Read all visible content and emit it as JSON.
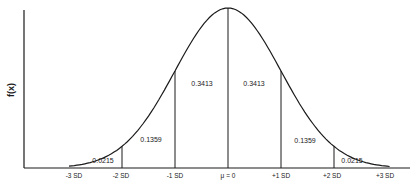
{
  "chart_data": {
    "type": "line",
    "title": "",
    "xlabel": "",
    "ylabel": "f(x)",
    "x_ticks": [
      "-3 SD",
      "-2 SD",
      "-1 SD",
      "μ = 0",
      "+1 SD",
      "+2 SD",
      "+3 SD"
    ],
    "x_tick_values": [
      -3,
      -2,
      -1,
      0,
      1,
      2,
      3
    ],
    "areas": [
      {
        "from": -3,
        "to": -2,
        "label": "0.0215"
      },
      {
        "from": -2,
        "to": -1,
        "label": "0.1359"
      },
      {
        "from": -1,
        "to": 0,
        "label": "0.3413"
      },
      {
        "from": 0,
        "to": 1,
        "label": "0.3413"
      },
      {
        "from": 1,
        "to": 2,
        "label": "0.1359"
      },
      {
        "from": 2,
        "to": 3,
        "label": "0.0215"
      }
    ],
    "xlim": [
      -3.2,
      3.2
    ],
    "grid": false,
    "legend": null
  },
  "labels": {
    "ylabel": "f(x)",
    "ticks": {
      "m3": "-3 SD",
      "m2": "-2 SD",
      "m1": "-1 SD",
      "mu": "μ = 0",
      "p1": "+1 SD",
      "p2": "+2 SD",
      "p3": "+3 SD"
    },
    "areas": {
      "a1": "0.0215",
      "a2": "0.1359",
      "a3": "0.3413",
      "a4": "0.3413",
      "a5": "0.1359",
      "a6": "0.0215"
    }
  }
}
